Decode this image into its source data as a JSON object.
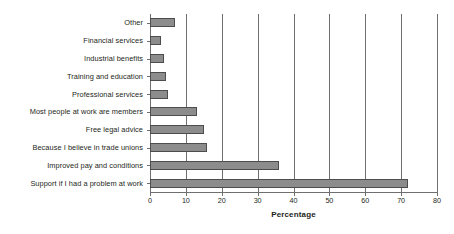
{
  "chart_data": {
    "type": "bar",
    "orientation": "horizontal",
    "title": "",
    "xlabel": "Percentage",
    "ylabel": "",
    "xlim": [
      0,
      80
    ],
    "xticks": [
      0,
      10,
      20,
      30,
      40,
      50,
      60,
      70,
      80
    ],
    "grid": true,
    "legend": null,
    "categories": [
      "Support if I had a problem at work",
      "Improved pay and conditions",
      "Because I believe in trade unions",
      "Free legal advice",
      "Most people at work are members",
      "Professional services",
      "Training and education",
      "Industrial benefits",
      "Financial services",
      "Other"
    ],
    "values": [
      72,
      36,
      16,
      15,
      13,
      5,
      4.5,
      4,
      3,
      7
    ],
    "series": [
      {
        "name": "Percentage",
        "values": [
          72,
          36,
          16,
          15,
          13,
          5,
          4.5,
          4,
          3,
          7
        ]
      }
    ]
  },
  "style": {
    "bar_fill": "#8c8c8c",
    "bar_stroke": "#4d4d4d",
    "axis_color": "#6f6f6f",
    "text_color": "#231f20",
    "background": "#ffffff"
  }
}
